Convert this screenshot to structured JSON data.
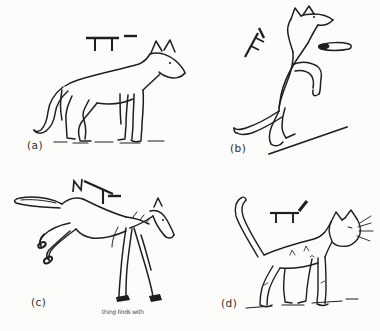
{
  "page": {
    "background": "#fcfcfa",
    "ink_color": "#1e1e1c",
    "label_color": "#2e2e2e"
  },
  "figure": {
    "description_note": "four black line drawings of animal postures, each with a stick-notation posture symbol above it",
    "panels": [
      {
        "label": "(a)",
        "animal": "dog-standing-side-view",
        "symbol": "horizontal-body-bar-with-two-legs-and-level-tail-dash"
      },
      {
        "label": "(b)",
        "animal": "dog-rearing-upright-on-slope",
        "symbol": "diagonal-body-bar-with-two-ticks-and-dash"
      },
      {
        "label": "(c)",
        "animal": "horse-bucking-kicking-hind-legs",
        "symbol": "downward-diagonal-body-bar-with-leg-dash-and-kick-zigzag",
        "annotation": "thing finds with"
      },
      {
        "label": "(d)",
        "animal": "cat-standing-tail-raised",
        "symbol": "horizontal-body-bar-with-two-legs-and-raised-tail-stroke"
      }
    ]
  }
}
